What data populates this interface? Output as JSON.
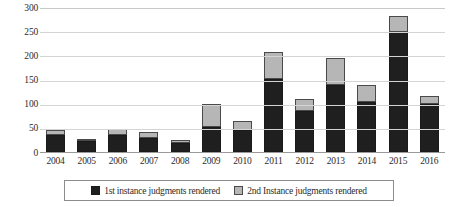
{
  "chart_data": {
    "type": "bar",
    "stacked": true,
    "title": "",
    "xlabel": "",
    "ylabel": "",
    "ylim": [
      0,
      300
    ],
    "ytick_step": 50,
    "ytick_labels": [
      "300",
      "250",
      "200",
      "150",
      "100",
      "50",
      "0"
    ],
    "grid": true,
    "legend_position": "bottom",
    "categories": [
      "2004",
      "2005",
      "2006",
      "2007",
      "2008",
      "2009",
      "2010",
      "2011",
      "2012",
      "2013",
      "2014",
      "2015",
      "2016"
    ],
    "series": [
      {
        "name": "1st instance judgments rendered",
        "color": "#1f1f1f",
        "values": [
          35,
          23,
          36,
          28,
          19,
          52,
          46,
          152,
          85,
          138,
          103,
          248,
          100
        ]
      },
      {
        "name": "2nd Instance judgments rendered",
        "color": "#b6b6b6",
        "values": [
          10,
          4,
          11,
          13,
          6,
          48,
          18,
          55,
          24,
          57,
          35,
          33,
          16
        ]
      }
    ],
    "totals": [
      45,
      27,
      47,
      41,
      25,
      100,
      64,
      207,
      109,
      195,
      138,
      281,
      116
    ]
  },
  "legend": {
    "items": [
      {
        "label": "1st instance judgments rendered",
        "swatch": "black-square-icon"
      },
      {
        "label": "2nd Instance judgments rendered",
        "swatch": "gray-square-icon"
      }
    ]
  },
  "colors": {
    "first_instance": "#1f1f1f",
    "second_instance": "#b6b6b6",
    "gridline": "#d4d4d4",
    "axis": "#9a9a9a",
    "text": "#2b2b2b"
  }
}
